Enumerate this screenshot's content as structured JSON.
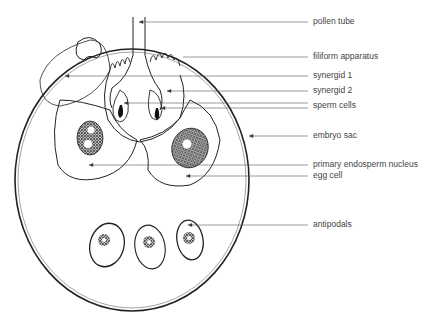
{
  "diagram": {
    "labels": [
      {
        "id": "pollen-tube",
        "text": "pollen tube",
        "y": 22
      },
      {
        "id": "filiform-apparatus",
        "text": "filiform apparatus",
        "y": 57
      },
      {
        "id": "synergid-1",
        "text": "synergid 1",
        "y": 76
      },
      {
        "id": "synergid-2",
        "text": "synergid 2",
        "y": 91
      },
      {
        "id": "sperm-cells",
        "text": "sperm cells",
        "y": 106
      },
      {
        "id": "embryo-sac",
        "text": "embryo sac",
        "y": 136
      },
      {
        "id": "primary-endosperm-nucleus",
        "text": "primary endosperm nucleus",
        "y": 165
      },
      {
        "id": "egg-cell",
        "text": "egg cell",
        "y": 176
      },
      {
        "id": "antipodals",
        "text": "antipodals",
        "y": 225
      }
    ],
    "colors": {
      "ink": "#222222",
      "line": "#555555",
      "text": "#444444"
    }
  }
}
